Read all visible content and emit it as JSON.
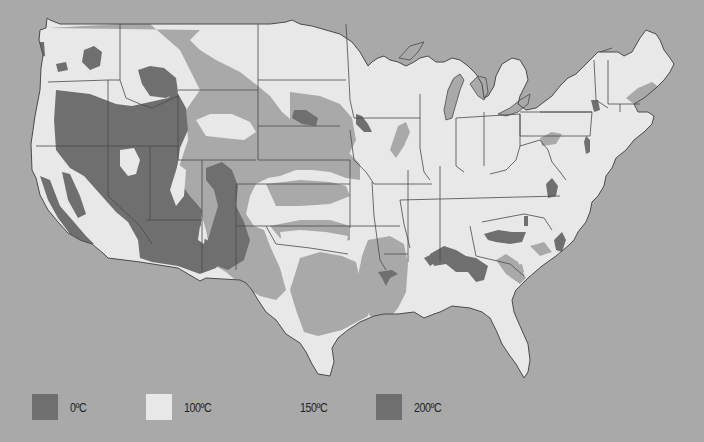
{
  "map": {
    "title": "",
    "background_color": "#a9a9a9",
    "land_color": "#e8e8e8",
    "border_color": "#4a4a4a",
    "zone_colors": {
      "z0": "#6f6f6f",
      "z100": "#e8e8e8",
      "z150": "#a9a9a9",
      "z200": "#6f6f6f"
    },
    "outline": "M47,18 L46,28 L40,30 L39,40 L43,55 L41,68 L40,90 L35,116 L31,144 L32,170 L36,178 L40,195 L48,210 L58,222 L68,233 L80,240 L92,244 L104,254 L108,258 L140,262 L178,268 L200,281 L206,278 L240,280 L246,283 L252,290 L258,300 L266,312 L276,320 L286,334 L300,343 L306,352 L312,364 L318,374 L330,376 L334,362 L332,348 L338,338 L348,330 L360,322 L374,316 L384,314 L398,314 L414,312 L424,318 L434,314 L440,312 L452,306 L470,308 L482,312 L490,318 L496,330 L502,344 L510,356 L516,364 L524,378 L528,372 L530,360 L528,344 L520,326 L514,312 L512,300 L516,290 L528,278 L542,266 L556,256 L568,246 L574,240 L578,232 L586,222 L590,212 L592,202 L598,196 L604,186 L606,176 L612,168 L616,158 L626,150 L634,140 L644,132 L652,124 L654,116 L648,112 L638,112 L634,104 L644,98 L656,88 L664,80 L670,72 L674,64 L670,58 L664,50 L660,40 L656,34 L646,30 L640,38 L632,52 L624,56 L618,52 L598,52 L592,58 L584,66 L576,74 L568,78 L560,86 L552,96 L544,102 L536,108 L526,110 L518,104 L520,96 L524,88 L528,80 L526,70 L520,60 L512,58 L502,64 L496,76 L494,86 L488,96 L484,98 L482,84 L476,74 L468,66 L460,60 L452,58 L444,62 L436,62 L428,56 L420,58 L414,62 L406,66 L398,62 L390,60 L384,56 L378,58 L372,62 L368,66 L360,52 L352,42 L340,34 L326,30 L312,26 L300,24 L292,20 L286,22 L270,24 L250,24 L200,24 L150,24 L100,24 L60,24 L50,20 Z",
    "lakes": [
      "M399,58 L410,46 L424,42 L418,52 L410,60 Z",
      "M444,110 L448,90 L454,78 L460,74 L464,80 L460,90 L456,104 L452,118 L446,120 Z",
      "M470,84 L478,76 L486,78 L488,92 L484,100 L478,96 Z",
      "M498,114 L510,108 L520,100 L530,94 L528,104 L518,112 L506,116 Z"
    ],
    "state_borders": [
      "M48,82 L108,80 L120,80",
      "M36,146 L108,146 L178,146",
      "M108,80 L108,146",
      "M120,24 L120,80 L126,98 L140,104 L152,108 L178,96",
      "M108,146 L108,196 L140,226 L152,244",
      "M150,146 L150,220",
      "M178,96 L178,160",
      "M178,160 L256,160",
      "M202,160 L202,272",
      "M146,220 L202,220",
      "M178,90 L258,90",
      "M258,24 L258,160",
      "M258,80 L346,80",
      "M258,126 L340,126",
      "M346,24 L348,60 L350,100 L354,118",
      "M354,118 L420,118",
      "M258,160 L350,160",
      "M236,184 L350,184",
      "M236,184 L236,270",
      "M350,160 L350,228",
      "M236,226 L350,226",
      "M266,226 L276,244 L310,248 L348,254",
      "M350,130 L354,160 L366,172 L374,184",
      "M374,184 L432,184",
      "M372,182 L374,216",
      "M374,216 L380,260 L386,270",
      "M350,226 L384,226",
      "M384,226 L400,226",
      "M384,254 L408,254",
      "M400,200 L404,224 L410,248",
      "M408,170 L408,262",
      "M440,166 L440,262",
      "M400,200 L560,196",
      "M420,94 L420,148 L424,172 L430,180",
      "M456,118 L456,166 L464,172",
      "M484,112 L484,166",
      "M456,118 L520,114 L520,146",
      "M520,114 L520,136 L590,136 L592,112 L520,112",
      "M520,146 L516,160 L506,170 L490,174",
      "M520,146 L540,140 L548,150 L552,162 L560,172 L566,180",
      "M470,226 L476,256 L510,264 L524,276",
      "M482,222 L524,214 L544,218 L552,230",
      "M540,112 L592,112",
      "M594,60 L596,100 L608,108",
      "M608,60 L608,104",
      "M608,104 L640,104",
      "M620,104 L620,112",
      "M600,52 L612,48"
    ],
    "zones": [
      {
        "id": "z0-west",
        "cls": "z0",
        "d": "M56,90 L90,94 L116,104 L132,106 L150,102 L168,98 L176,90 L186,108 L188,130 L180,148 L176,176 L190,196 L202,210 L200,236 L214,244 L226,256 L216,268 L200,274 L178,266 L152,262 L140,258 L138,240 L128,222 L116,212 L100,194 L84,176 L70,168 L56,150 L54,120 Z"
      },
      {
        "id": "z0-idaho",
        "cls": "z0",
        "d": "M138,70 L150,66 L164,68 L176,78 L178,92 L166,98 L150,96 L142,84 Z"
      },
      {
        "id": "z0-wa-spot",
        "cls": "z0",
        "d": "M84,50 L94,46 L102,52 L100,66 L90,70 L82,62 Z"
      },
      {
        "id": "z0-wa-spot2",
        "cls": "z0",
        "d": "M56,64 L66,62 L68,70 L58,72 Z"
      },
      {
        "id": "z0-olympic",
        "cls": "z0",
        "d": "M36,42 L44,42 L45,56 L38,58 Z"
      },
      {
        "id": "z0-colorado",
        "cls": "z0",
        "d": "M206,168 L222,162 L232,170 L238,186 L236,206 L244,222 L250,240 L244,260 L228,270 L212,264 L206,246 L212,226 L218,206 L214,190 L206,180 Z"
      },
      {
        "id": "z0-calcoast",
        "cls": "z0",
        "d": "M40,176 L50,180 L60,206 L74,222 L86,236 L94,244 L82,244 L70,234 L58,218 L48,200 Z"
      },
      {
        "id": "z0-sierra",
        "cls": "z0",
        "d": "M62,172 L70,174 L80,196 L86,214 L78,218 L68,200 Z"
      },
      {
        "id": "z0-arkansas",
        "cls": "z0",
        "d": "M378,272 L392,270 L398,274 L390,278 L386,286 L382,278 Z"
      },
      {
        "id": "z0-iowa",
        "cls": "z0",
        "d": "M356,114 L362,116 L368,124 L372,132 L364,132 L356,124 Z"
      },
      {
        "id": "z0-ne",
        "cls": "z0",
        "d": "M294,110 L306,110 L318,118 L316,126 L302,124 L292,118 Z"
      },
      {
        "id": "z0-deepsouth",
        "cls": "z0",
        "d": "M430,254 L444,246 L456,250 L466,256 L476,258 L488,266 L484,280 L476,282 L468,272 L456,272 L446,264 L434,266 Z"
      },
      {
        "id": "z0-tn",
        "cls": "z0",
        "d": "M484,234 L498,230 L512,232 L526,232 L522,242 L510,244 L496,242 L488,240 Z"
      },
      {
        "id": "z0-wv",
        "cls": "z0",
        "d": "M546,184 L552,178 L558,186 L556,196 L548,198 Z"
      },
      {
        "id": "z0-ny",
        "cls": "z0",
        "d": "M591,100 L598,100 L600,110 L594,112 Z"
      },
      {
        "id": "z0-pa",
        "cls": "z0",
        "d": "M586,136 L590,140 L590,152 L586,154 L584,142 Z"
      },
      {
        "id": "z0-va",
        "cls": "z0",
        "d": "M524,216 L528,216 L528,226 L524,226 Z"
      },
      {
        "id": "z0-nc",
        "cls": "z0",
        "d": "M554,240 L562,232 L566,240 L562,252 L556,250 Z"
      },
      {
        "id": "z0-ar2",
        "cls": "z0",
        "d": "M424,258 L432,254 L436,262 L430,266 Z"
      }
    ],
    "zones150": [
      {
        "id": "z150-nw",
        "d": "M48,28 L120,24 L150,24 L180,50 L190,70 L200,90 L186,110 L188,140 L176,176 L200,210 L206,230 L212,264 L226,272 L240,284 L260,296 L276,300 L286,290 L280,268 L270,246 L264,230 L254,226 L246,214 L250,196 L256,184 L268,178 L280,176 L296,170 L312,170 L330,172 L346,178 L360,180 L360,164 L346,150 L326,142 L310,132 L296,124 L282,112 L270,96 L258,86 L240,72 L216,60 L200,50 L190,40 L200,30 Z"
      },
      {
        "id": "z150-plains",
        "d": "M290,92 L320,96 L340,104 L352,118 L356,140 L348,156 L330,156 L312,150 L296,140 L290,126 Z"
      },
      {
        "id": "z150-tx",
        "d": "M300,258 L320,252 L342,256 L356,262 L360,280 L372,298 L368,316 L342,330 L318,336 L304,332 L296,310 L290,290 Z"
      },
      {
        "id": "z150-la",
        "d": "M368,240 L390,236 L404,244 L408,264 L406,292 L398,308 L388,320 L370,316 L362,300 L358,276 L362,256 Z"
      },
      {
        "id": "z150-ok",
        "d": "M270,226 L300,220 L330,220 L350,226 L350,240 L330,244 L300,242 L280,238 Z"
      },
      {
        "id": "z150-ks",
        "d": "M266,184 L300,180 L330,182 L346,186 L350,196 L330,204 L300,206 L276,206 Z"
      },
      {
        "id": "z150-il",
        "d": "M398,126 L406,122 L410,132 L404,146 L396,158 L390,150 Z"
      },
      {
        "id": "z150-mi",
        "d": "M446,108 L448,90 L452,80 L458,78 L456,98 L454,112 L450,120 Z"
      },
      {
        "id": "z150-oh",
        "d": "M540,138 L552,132 L562,134 L556,144 L542,146 Z"
      },
      {
        "id": "z150-me",
        "d": "M626,98 L638,88 L652,82 L660,88 L650,96 L634,104 Z"
      },
      {
        "id": "z150-ga",
        "d": "M496,260 L506,254 L518,262 L526,278 L520,284 L506,274 Z"
      },
      {
        "id": "z150-nc",
        "d": "M530,246 L544,242 L552,252 L540,256 Z"
      },
      {
        "id": "z150-ca-s",
        "d": "M68,238 L84,240 L96,250 L106,260 L96,262 L82,256 L72,248 Z"
      },
      {
        "id": "z150-fl-pan",
        "d": "M514,266 L522,264 L524,272 L516,274 Z"
      }
    ],
    "zones100_spots": [
      {
        "id": "z100-ut",
        "d": "M120,150 L134,148 L140,160 L136,174 L128,176 L120,166 Z"
      },
      {
        "id": "z100-wy",
        "d": "M196,120 L210,114 L232,114 L250,122 L256,132 L244,140 L224,138 L206,136 Z"
      },
      {
        "id": "z100-co-w",
        "d": "M178,164 L186,170 L184,196 L176,206 L170,190 Z"
      },
      {
        "id": "z100-nm-w",
        "d": "M200,226 L206,230 L204,244 L198,240 Z"
      },
      {
        "id": "z100-ca-w",
        "d": "M40,146 L52,148 L60,166 L58,176 L48,174 L40,160 Z"
      },
      {
        "id": "z100-ok-w",
        "d": "M280,232 L300,230 L326,232 L348,236 L346,244 L320,248 L296,246 L282,242 Z"
      }
    ]
  },
  "legend": {
    "items": [
      {
        "label": "0ºC",
        "color": "#6f6f6f",
        "left": 32
      },
      {
        "label": "100ºC",
        "color": "#e8e8e8",
        "left": 146
      },
      {
        "label": "150ºC",
        "color": "#a9a9a9",
        "left": 262
      },
      {
        "label": "200ºC",
        "color": "#6f6f6f",
        "left": 376
      }
    ]
  }
}
